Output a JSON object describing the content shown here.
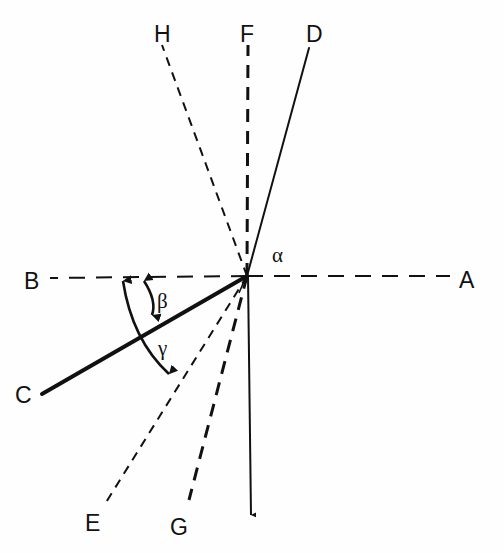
{
  "figure": {
    "type": "geometric-angle-diagram",
    "background_color": "#fefefe",
    "stroke_color": "#111111",
    "width": 504,
    "height": 553,
    "origin": {
      "x": 247,
      "y": 276
    }
  },
  "rays": [
    {
      "id": "A",
      "label": "A",
      "label_x": 460,
      "label_y": 288,
      "from_x": 247,
      "from_y": 276,
      "to_x": 450,
      "to_y": 276,
      "style": "dashed",
      "dash_pattern": "16,11",
      "width": 2.0,
      "arrow": false,
      "direction_deg": 0
    },
    {
      "id": "B",
      "label": "B",
      "label_x": 24,
      "label_y": 290,
      "from_x": 247,
      "from_y": 276,
      "to_x": 50,
      "to_y": 278,
      "style": "dashed",
      "dash_pattern": "16,11",
      "width": 2.0,
      "arrow": false,
      "direction_deg": 180
    },
    {
      "id": "C",
      "label": "C",
      "label_x": 16,
      "label_y": 403,
      "from_x": 247,
      "from_y": 276,
      "to_x": 42,
      "to_y": 394,
      "style": "solid",
      "dash_pattern": "none",
      "width": 4.0,
      "arrow": false,
      "direction_deg": 210
    },
    {
      "id": "D",
      "label": "D",
      "label_x": 307,
      "label_y": 42,
      "from_x": 247,
      "from_y": 276,
      "to_x": 309,
      "to_y": 48,
      "style": "solid",
      "dash_pattern": "none",
      "width": 2.0,
      "arrow": false,
      "direction_deg": 75
    },
    {
      "id": "E",
      "label": "E",
      "label_x": 86,
      "label_y": 530,
      "from_x": 247,
      "from_y": 276,
      "to_x": 105,
      "to_y": 504,
      "style": "fine-dashed",
      "dash_pattern": "9,7",
      "width": 2.0,
      "arrow": false,
      "direction_deg": 238
    },
    {
      "id": "F",
      "label": "F",
      "label_x": 240,
      "label_y": 42,
      "from_x": 247,
      "from_y": 276,
      "to_x": 248,
      "to_y": 45,
      "style": "coarse-dashed",
      "dash_pattern": "13,9",
      "width": 3.0,
      "arrow": false,
      "direction_deg": 90
    },
    {
      "id": "F-down",
      "label": "",
      "label_x": 0,
      "label_y": 0,
      "from_x": 248,
      "from_y": 276,
      "to_x": 251,
      "to_y": 519,
      "style": "solid",
      "dash_pattern": "none",
      "width": 2.0,
      "arrow": true,
      "direction_deg": 270
    },
    {
      "id": "G",
      "label": "G",
      "label_x": 171,
      "label_y": 534,
      "from_x": 247,
      "from_y": 276,
      "to_x": 189,
      "to_y": 500,
      "style": "coarse-dashed",
      "dash_pattern": "13,9",
      "width": 3.0,
      "arrow": false,
      "direction_deg": 255
    },
    {
      "id": "H",
      "label": "H",
      "label_x": 154,
      "label_y": 42,
      "from_x": 247,
      "from_y": 276,
      "to_x": 162,
      "to_y": 45,
      "style": "fine-dashed",
      "dash_pattern": "9,7",
      "width": 2.0,
      "arrow": false,
      "direction_deg": 110
    }
  ],
  "angles": [
    {
      "id": "alpha",
      "symbol": "α",
      "label_x": 272,
      "label_y": 261,
      "between": "F-D",
      "marker": "small-tick",
      "tick_path": "M 238 292 L 244 280"
    },
    {
      "id": "beta",
      "symbol": "β",
      "label_x": 157,
      "label_y": 307,
      "between": "B-C",
      "arc_path": "M 143 277 Q 157 300 153 319",
      "arrow_start": true,
      "arrow_end": true
    },
    {
      "id": "gamma",
      "symbol": "γ",
      "label_x": 157,
      "label_y": 354,
      "between": "B-E",
      "arc_path": "M 122 277 Q 132 339 172 377",
      "arrow_start": true,
      "arrow_end": true
    }
  ]
}
